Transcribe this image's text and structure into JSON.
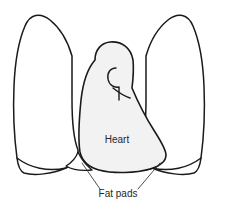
{
  "figure": {
    "type": "anatomical-line-diagram",
    "canvas": {
      "width": 225,
      "height": 212
    },
    "background_color": "#ffffff"
  },
  "colors": {
    "outline": "#1a1a1a",
    "heart_fill": "#f2f2f2",
    "lung_fill": "#ffffff",
    "fatpad_fill": "#ffffff",
    "leader_line": "#3a3a3a",
    "label_text": "#262626"
  },
  "labels": {
    "heart": {
      "text": "Heart",
      "x": 117,
      "y": 140,
      "font_size": 10
    },
    "fat_pads": {
      "text": "Fat pads",
      "x": 118,
      "y": 194,
      "font_size": 10
    }
  },
  "leader_lines": [
    {
      "name": "left-fatpad-leader",
      "x1": 100,
      "y1": 189,
      "x2": 82,
      "y2": 163
    },
    {
      "name": "right-fatpad-leader",
      "x1": 138,
      "y1": 189,
      "x2": 160,
      "y2": 163
    }
  ],
  "shapes": {
    "left_lung": "M 72 56 C 68 42 60 28 50 20 C 40 12 30 14 25 26 C 19 40 15 62 14 86 C 13 110 14 136 17 158 C 18 166 20 171 24 173 C 34 176 52 174 66 168 C 72 165 76 161 78 156 L 78 150 C 74 140 72 120 72 100 Z",
    "right_lung": "M 146 56 C 150 42 158 28 168 20 C 178 12 188 14 193 26 C 199 40 203 62 204 86 C 205 110 204 136 201 158 C 200 166 198 171 194 173 C 184 176 166 174 152 168 C 146 165 142 161 140 156 L 140 150 C 144 140 146 120 146 100 Z",
    "heart": "M 95 60 C 95 50 101 43 110 42 C 122 41 131 48 133 60 C 134 70 133 80 132 88 C 137 100 146 118 155 132 C 162 143 166 150 166 155 C 166 161 160 166 150 169 C 136 173 114 174 99 170 C 88 167 82 161 80 152 C 78 140 79 120 81 100 C 83 82 88 68 95 60 Z",
    "aortic_arch": "M 116 68 C 110 68 107 73 108 79 C 109 85 114 88 119 87 L 119 100",
    "aortic_arch_lower": "M 113 88 C 118 92 124 96 130 98",
    "left_fatpad": "M 78 152 C 76 158 71 163 66 166 C 73 170 83 171 92 170 C 86 165 81 159 78 152 Z",
    "right_fatpad": "M 146 152 C 148 158 153 163 158 166 C 151 170 141 171 132 170 C 138 165 143 159 146 152 Z",
    "left_diaphragm": "M 17 158 C 30 168 48 172 66 168",
    "right_diaphragm": "M 201 158 C 188 168 170 172 152 168"
  }
}
